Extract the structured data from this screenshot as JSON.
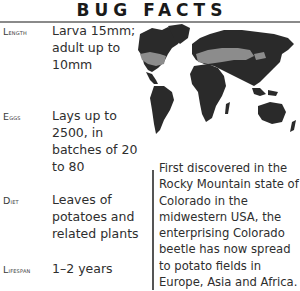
{
  "title": "BUG FACTS",
  "facts": [
    {
      "label": "Length",
      "value": "Larva 15mm; adult up to 10mm"
    },
    {
      "label": "Eggs",
      "value": "Lays up to 2500, in batches of 20 to 80"
    },
    {
      "label": "Diet",
      "value": "Leaves of potatoes and related plants"
    },
    {
      "label": "Lifespan",
      "value": "1–2 years"
    }
  ],
  "map": {
    "description": "World map showing spread of Colorado beetle",
    "colors": {
      "land": "#2a2a2a",
      "range": "#8c8c8c",
      "background": "#ffffff"
    }
  },
  "blurb": "First discovered in the Rocky Mountain state of Colorado in the midwestern USA, the enterprising Colorado beetle has now spread to potato fields in Europe, Asia and Africa."
}
